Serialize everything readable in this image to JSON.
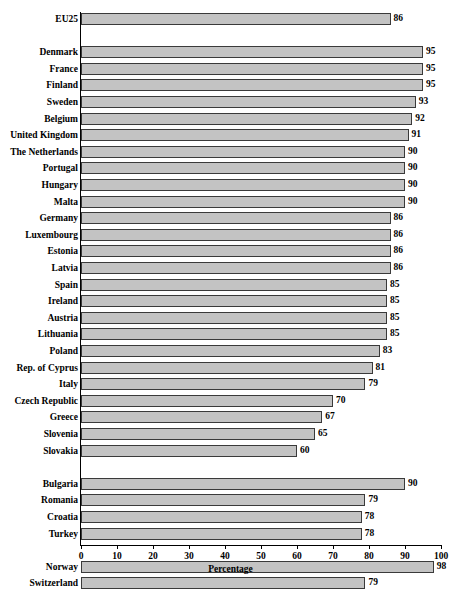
{
  "chart_data": {
    "type": "bar",
    "orientation": "horizontal",
    "title": "",
    "xlabel": "Percentage",
    "ylabel": "",
    "xlim": [
      0,
      100
    ],
    "xticks": [
      0,
      10,
      20,
      30,
      40,
      50,
      60,
      70,
      80,
      90,
      100
    ],
    "xtick_labels": [
      "0",
      "10",
      "20",
      "30",
      "40",
      "50",
      "60",
      "70",
      "80",
      "90",
      "100"
    ],
    "grid": false,
    "legend": null,
    "bar_color": "#c3c3c3",
    "bar_edge_color": "#3a3a3a",
    "value_labels": true,
    "categories": [
      "EU25",
      "Denmark",
      "France",
      "Finland",
      "Sweden",
      "Belgium",
      "United Kingdom",
      "The Netherlands",
      "Portugal",
      "Hungary",
      "Malta",
      "Germany",
      "Luxembourg",
      "Estonia",
      "Latvia",
      "Spain",
      "Ireland",
      "Austria",
      "Lithuania",
      "Poland",
      "Rep. of Cyprus",
      "Italy",
      "Czech Republic",
      "Greece",
      "Slovenia",
      "Slovakia",
      "Bulgaria",
      "Romania",
      "Croatia",
      "Turkey",
      "Norway",
      "Switzerland",
      "Iceland"
    ],
    "values": [
      86,
      95,
      95,
      95,
      93,
      92,
      91,
      90,
      90,
      90,
      90,
      86,
      86,
      86,
      86,
      85,
      85,
      85,
      85,
      83,
      81,
      79,
      70,
      67,
      65,
      60,
      90,
      79,
      78,
      78,
      98,
      79,
      62
    ],
    "groups": [
      {
        "name": "aggregate",
        "start": 0,
        "count": 1
      },
      {
        "name": "eu-member-states",
        "start": 1,
        "count": 25
      },
      {
        "name": "candidate-countries",
        "start": 26,
        "count": 4
      },
      {
        "name": "efta-countries",
        "start": 30,
        "count": 3
      }
    ]
  }
}
